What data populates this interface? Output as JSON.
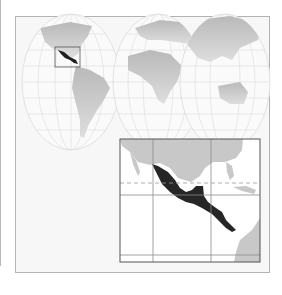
{
  "map": {
    "title": "Mexico and Central America locator map",
    "world_map": {
      "projection": "interrupted (three-lobe) world projection",
      "land_color": "#c4c4c4",
      "ocean_color": "#f5f5f5",
      "graticule_color": "#d8d8d8",
      "highlight_region": "Mexico and Central America",
      "highlight_color": "#222222",
      "locator_box_color": "#555555"
    },
    "inset_map": {
      "region": "Mexico and Central America",
      "land_color": "#c8c8c8",
      "water_color": "#ffffff",
      "highlight_color": "#262626",
      "grid_color": "#8a8a8a",
      "tropic_line_style": "dashed",
      "border_color": "#555555"
    },
    "frame_border_color": "#b3b3b3"
  }
}
